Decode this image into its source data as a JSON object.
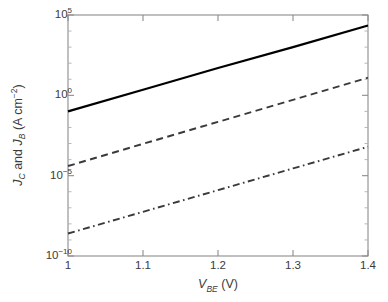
{
  "chart_data": {
    "type": "line",
    "title": "",
    "xlabel": "V_BE (V)",
    "xlabel_parts": {
      "var": "V",
      "sub": "BE",
      "unit": "(V)"
    },
    "ylabel": "J_C and J_B (A cm^-2)",
    "ylabel_parts": {
      "var1": "J",
      "sub1": "C",
      "conj": " and ",
      "var2": "J",
      "sub2": "B",
      "unit": " (A cm",
      "unit_sup": "−2",
      "unit_close": ")"
    },
    "xscale": "linear",
    "yscale": "log",
    "xlim": [
      1.0,
      1.4
    ],
    "ylim": [
      1e-10,
      100000.0
    ],
    "grid": false,
    "legend": "none",
    "xticks": [
      1,
      1.1,
      1.2,
      1.3,
      1.4
    ],
    "xtick_labels": [
      "1",
      "1.1",
      "1.2",
      "1.3",
      "1.4"
    ],
    "yticks": [
      100000.0,
      1.0,
      1e-05,
      1e-10
    ],
    "ytick_labels": [
      {
        "mantissa": "10",
        "exponent": "5"
      },
      {
        "mantissa": "10",
        "exponent": "0"
      },
      {
        "mantissa": "10",
        "exponent": "−5"
      },
      {
        "mantissa": "10",
        "exponent": "−10"
      }
    ],
    "series": [
      {
        "name": "J_C (collector current density)",
        "style": "solid",
        "color": "#000000",
        "x": [
          1.0,
          1.1,
          1.2,
          1.3,
          1.4
        ],
        "y_log10": [
          -1.0,
          0.35,
          1.7,
          3.0,
          4.35
        ],
        "y": [
          0.1,
          2.24,
          50.1,
          1000.0,
          22387.2
        ]
      },
      {
        "name": "J_B (base current density)",
        "style": "dashed",
        "color": "#3a3a3a",
        "x": [
          1.0,
          1.1,
          1.2,
          1.3,
          1.4
        ],
        "y_log10": [
          -4.4,
          -3.02,
          -1.65,
          -0.28,
          1.1
        ],
        "y": [
          3.98e-05,
          0.000955,
          0.0224,
          0.525,
          12.59
        ]
      },
      {
        "name": "J_B (alternative, dash-dot)",
        "style": "dashdot",
        "color": "#3a3a3a",
        "x": [
          1.0,
          1.1,
          1.2,
          1.3,
          1.4
        ],
        "y_log10": [
          -8.6,
          -7.25,
          -5.9,
          -4.55,
          -3.2
        ],
        "y": [
          2.51e-09,
          5.62e-08,
          1.26e-06,
          2.82e-05,
          0.000631
        ]
      }
    ],
    "axis_box": {
      "left": 68,
      "right": 368,
      "top": 15,
      "bottom": 256
    },
    "axis_color": "#8c8c8c"
  }
}
